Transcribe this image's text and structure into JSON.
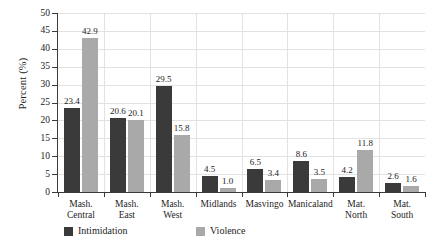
{
  "chart_data": {
    "type": "bar",
    "title": "",
    "subtitle": "",
    "xlabel": "",
    "ylabel": "Percent (%)",
    "ylim": [
      0,
      50
    ],
    "yticks": [
      0,
      5,
      10,
      15,
      20,
      25,
      30,
      35,
      40,
      45,
      50
    ],
    "ytick_labels": [
      "0",
      "5",
      "10",
      "15",
      "20",
      "25",
      "30",
      "35",
      "40",
      "45",
      "50"
    ],
    "grid": "horizontal-and-vertical-faint",
    "legend_position": "bottom-left",
    "categories": [
      [
        "Mash.",
        "Central"
      ],
      [
        "Mash.",
        "East"
      ],
      [
        "Mash.",
        "West"
      ],
      [
        "Midlands"
      ],
      [
        "Masvingo"
      ],
      [
        "Manicaland"
      ],
      [
        "Mat.",
        "North"
      ],
      [
        "Mat.",
        "South"
      ]
    ],
    "category_labels": [
      "Mash. Central",
      "Mash. East",
      "Mash. West",
      "Midlands",
      "Masvingo",
      "Manicaland",
      "Mat. North",
      "Mat. South"
    ],
    "series": [
      {
        "name": "Intimidation",
        "color": "#3a3a3a",
        "values": [
          23.4,
          20.6,
          29.5,
          4.5,
          6.5,
          8.6,
          4.2,
          2.6
        ],
        "labels": [
          "23.4",
          "20.6",
          "29.5",
          "4.5",
          "6.5",
          "8.6",
          "4.2",
          "2.6"
        ]
      },
      {
        "name": "Violence",
        "color": "#a9a9a9",
        "values": [
          42.9,
          20.1,
          15.8,
          1.0,
          3.4,
          3.5,
          11.8,
          1.6
        ],
        "labels": [
          "42.9",
          "20.1",
          "15.8",
          "1.0",
          "3.4",
          "3.5",
          "11.8",
          "1.6"
        ]
      }
    ]
  },
  "legend": {
    "items": [
      {
        "label": "Intimidation",
        "color": "#3a3a3a"
      },
      {
        "label": "Violence",
        "color": "#a9a9a9"
      }
    ]
  }
}
